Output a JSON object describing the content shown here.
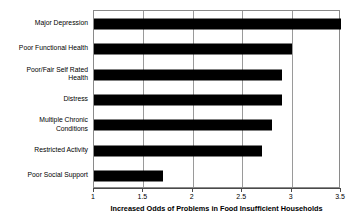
{
  "chart_data": {
    "type": "bar",
    "orientation": "horizontal",
    "title": "",
    "xlabel": "Increased Odds of Problems in Food Insufficient Households",
    "ylabel": "",
    "xlim": [
      1,
      3.5
    ],
    "xticks": [
      "1",
      "1.5",
      "2",
      "2.5",
      "3",
      "3.5"
    ],
    "xtick_values": [
      1,
      1.5,
      2,
      2.5,
      3,
      3.5
    ],
    "grid": true,
    "legend": false,
    "bar_color": "#000000",
    "categories": [
      "Major Depression",
      "Poor Functional Health",
      "Poor/Fair Self Rated\nHealth",
      "Distress",
      "Multiple Chronic\nConditions",
      "Restricted Activity",
      "Poor Social Support"
    ],
    "values": [
      3.5,
      3.0,
      2.9,
      2.9,
      2.8,
      2.7,
      1.7
    ]
  }
}
